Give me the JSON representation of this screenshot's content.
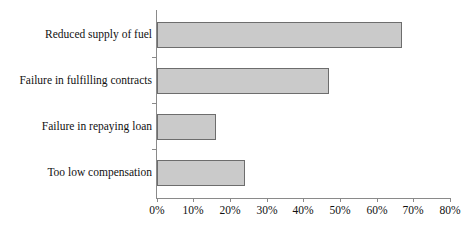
{
  "chart_data": {
    "type": "bar",
    "orientation": "horizontal",
    "title": "",
    "subtitle": "",
    "xlabel": "",
    "ylabel": "",
    "categories": [
      "Reduced supply of fuel",
      "Failure in fulfilling contracts",
      "Failure in repaying loan",
      "Too low compensation"
    ],
    "values": [
      67,
      47,
      16,
      24
    ],
    "value_suffix": "%",
    "xlim": [
      0,
      80
    ],
    "xticks": [
      0,
      10,
      20,
      30,
      40,
      50,
      60,
      70,
      80
    ],
    "xtick_labels": [
      "0%",
      "10%",
      "20%",
      "30%",
      "40%",
      "50%",
      "60%",
      "70%",
      "80%"
    ],
    "grid": false,
    "legend": null,
    "legend_position": "none",
    "annotations": [],
    "series": [
      {
        "name": "",
        "values": [
          67,
          47,
          16,
          24
        ]
      }
    ],
    "colors": {
      "bar_fill": "#cacaca",
      "bar_border": "#6d6d6d",
      "axis": "#8a8a8a",
      "text": "#111111",
      "background": "#ffffff"
    }
  }
}
